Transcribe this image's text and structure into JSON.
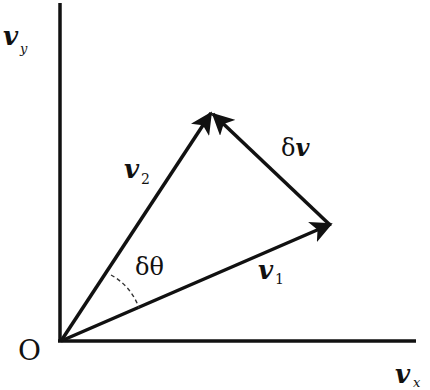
{
  "diagram": {
    "origin_label": "O",
    "axes": {
      "x": {
        "symbol": "v",
        "subscript": "x"
      },
      "y": {
        "symbol": "v",
        "subscript": "y"
      }
    },
    "vectors": [
      {
        "id": "v1",
        "symbol": "v",
        "subscript": "1",
        "from": "O",
        "to": "tip1"
      },
      {
        "id": "v2",
        "symbol": "v",
        "subscript": "2",
        "from": "O",
        "to": "tip2"
      },
      {
        "id": "dv",
        "symbol": "δv",
        "from": "tip1",
        "to": "tip2"
      }
    ],
    "angle": {
      "label": "δθ",
      "between": [
        "v1",
        "v2"
      ],
      "style": "dashed arc"
    },
    "colors": {
      "ink": "#111111",
      "background": "#ffffff"
    }
  }
}
